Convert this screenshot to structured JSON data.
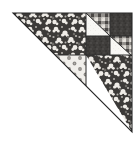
{
  "image": {
    "title": "Quilt Block Half-Square Triangle",
    "alt_text": "Pieced fabric quilt block shaped as a right triangle",
    "width": 139,
    "height": 147,
    "background_color": "#ffffff"
  },
  "block": {
    "shape": "right-triangle",
    "right_angle_corner": "top-right",
    "apex_top_left": [
      13,
      13
    ],
    "corner_top_right": [
      132,
      13
    ],
    "corner_bottom_right": [
      132,
      132
    ],
    "seam_color": "#2b2b2b",
    "seam_width": 1
  },
  "palette": {
    "floral_dark_base": "#3c3a38",
    "floral_dark_motif": "#f2f0ec",
    "floral_mid_motif": "#b9b6b1",
    "gingham_dark": "#4a4745",
    "gingham_mid": "#8f8c88",
    "gingham_light": "#ece9e4",
    "solid_dark": "#413f3d",
    "dot_ground": "#f0eeea",
    "dot_spot": "#8d8a86",
    "plain_light": "#f7f6f3",
    "background": "#ffffff",
    "outline": "#262626"
  },
  "patches": [
    {
      "id": "patch-main-floral",
      "name": "large-floral-triangle",
      "fabric": "dark-floral-print",
      "description": "Large dark floral triangle filling the upper-left portion of the block",
      "points": "13,13 86,13 86,55 55,55 55,86 13,86"
    },
    {
      "id": "patch-hst-top-left-light",
      "name": "half-square-triangle-light-upper-left",
      "fabric": "light-plain",
      "description": "Light triangle half of the top-left gingham unit",
      "points": "86,13 86,55 109,36 109,13"
    },
    {
      "id": "patch-hst-top-left-gingham",
      "name": "half-square-triangle-gingham-upper-left",
      "fabric": "gingham-check",
      "description": "Gingham check triangle half of the top-left unit",
      "points": "86,13 109,13 109,36"
    },
    {
      "id": "patch-solid-top-right",
      "name": "solid-dark-square-top-right",
      "fabric": "dark-solid-texture",
      "description": "Dark solid square at the top-right of the block",
      "points": "109,13 132,13 132,36 109,36"
    },
    {
      "id": "patch-solid-mid-left",
      "name": "solid-dark-square-middle-left",
      "fabric": "dark-solid-texture",
      "description": "Dark solid square below the top-left gingham unit",
      "points": "86,36 109,36 109,55 86,55"
    },
    {
      "id": "patch-hst-mid-right-gingham",
      "name": "half-square-triangle-gingham-middle-right",
      "fabric": "gingham-check",
      "description": "Gingham check triangle of the middle-right unit",
      "points": "109,36 132,36 132,55 109,55"
    },
    {
      "id": "patch-hst-mid-right-light",
      "name": "half-square-triangle-light-middle-right",
      "fabric": "light-plain",
      "description": "Light triangle of the middle-right unit",
      "points": "109,36 132,55 109,55"
    },
    {
      "id": "patch-dots",
      "name": "polka-dot-triangle",
      "fabric": "light-polka-dot",
      "description": "Light polka dot fabric triangle in the centre of the block",
      "points": "55,55 86,55 86,86 55,86"
    },
    {
      "id": "patch-floral-lower-right",
      "name": "floral-triangle-lower-right",
      "fabric": "dark-floral-print",
      "description": "Dark floral triangle in the lower-right portion of the block",
      "points": "86,55 132,55 132,132"
    }
  ],
  "seams": [
    {
      "id": "seam-vertical-main",
      "name": "vertical-seam-center",
      "from": [
        86,
        13
      ],
      "to": [
        86,
        86
      ]
    },
    {
      "id": "seam-horizontal-main",
      "name": "horizontal-seam-center",
      "from": [
        55,
        55
      ],
      "to": [
        132,
        55
      ]
    },
    {
      "id": "seam-vertical-right",
      "name": "vertical-seam-right",
      "from": [
        109,
        13
      ],
      "to": [
        109,
        55
      ]
    },
    {
      "id": "seam-horizontal-upper",
      "name": "horizontal-seam-upper",
      "from": [
        86,
        36
      ],
      "to": [
        132,
        36
      ]
    },
    {
      "id": "seam-diagonal-hst-tl",
      "name": "diagonal-seam-top-left-unit",
      "from": [
        86,
        13
      ],
      "to": [
        109,
        36
      ]
    },
    {
      "id": "seam-diagonal-hst-mr",
      "name": "diagonal-seam-middle-right-unit",
      "from": [
        109,
        36
      ],
      "to": [
        132,
        55
      ]
    },
    {
      "id": "seam-hypotenuse",
      "name": "hypotenuse-edge",
      "from": [
        13,
        13
      ],
      "to": [
        132,
        132
      ]
    }
  ]
}
